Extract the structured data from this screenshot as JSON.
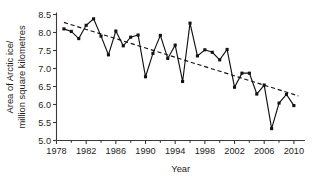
{
  "chart_data": {
    "type": "line",
    "title": "",
    "subtitle": "",
    "xlabel": "Year",
    "ylabel": "Area of Arctic ice/ million square kilometres",
    "ylabel_line1": "Area of Arctic ice/",
    "ylabel_line2": "million square kilometres",
    "xlim": [
      1978,
      2011.5
    ],
    "ylim": [
      5.0,
      8.5
    ],
    "xticks": [
      1978,
      1982,
      1986,
      1990,
      1994,
      1998,
      2002,
      2006,
      2010
    ],
    "xtick_labels": [
      "1978",
      "1982",
      "1986",
      "1990",
      "1994",
      "1998",
      "2002",
      "2006",
      "2010"
    ],
    "xticks_minor": [
      1980,
      1984,
      1988,
      1992,
      1996,
      2000,
      2004,
      2008
    ],
    "yticks": [
      5.0,
      5.5,
      6.0,
      6.5,
      7.0,
      7.5,
      8.0,
      8.5
    ],
    "ytick_labels": [
      "5.0",
      "5.5",
      "6.0",
      "6.5",
      "7.0",
      "7.5",
      "8.0",
      "8.5"
    ],
    "grid": false,
    "legend": "none",
    "marker": "square",
    "line_color": "#111111",
    "marker_color": "#111111",
    "trend_color": "#111111",
    "x": [
      1979,
      1980,
      1981,
      1982,
      1983,
      1984,
      1985,
      1986,
      1987,
      1988,
      1989,
      1990,
      1991,
      1992,
      1993,
      1994,
      1995,
      1996,
      1997,
      1998,
      1999,
      2000,
      2001,
      2002,
      2003,
      2004,
      2005,
      2006,
      2007,
      2008,
      2009,
      2010
    ],
    "values": [
      8.1,
      8.03,
      7.83,
      8.2,
      8.38,
      7.9,
      7.38,
      8.04,
      7.63,
      7.87,
      7.93,
      6.77,
      7.42,
      7.92,
      7.28,
      7.65,
      6.64,
      8.26,
      7.35,
      7.52,
      7.45,
      7.24,
      7.53,
      6.48,
      6.87,
      6.87,
      6.29,
      6.54,
      5.33,
      6.04,
      6.28,
      5.97
    ],
    "series": [
      {
        "name": "Arctic sea ice area",
        "values": [
          8.1,
          8.03,
          7.83,
          8.2,
          8.38,
          7.9,
          7.38,
          8.04,
          7.63,
          7.87,
          7.93,
          6.77,
          7.42,
          7.92,
          7.28,
          7.65,
          6.64,
          8.26,
          7.35,
          7.52,
          7.45,
          7.24,
          7.53,
          6.48,
          6.87,
          6.87,
          6.29,
          6.54,
          5.33,
          6.04,
          6.28,
          5.97
        ]
      },
      {
        "name": "Linear trend",
        "type": "trend",
        "x": [
          1979,
          2010.6
        ],
        "values": [
          8.28,
          6.24
        ]
      }
    ],
    "annotations": []
  },
  "figure": {
    "background_color": "#ffffff",
    "axis_color": "#3a3a3a",
    "text_color": "#1d1d1d"
  }
}
